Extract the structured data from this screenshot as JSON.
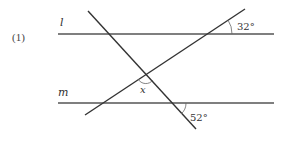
{
  "problem": {
    "number_label": "(1)"
  },
  "lines": {
    "l": {
      "label": "l",
      "y": 34,
      "x1": 58,
      "x2": 274
    },
    "m": {
      "label": "m",
      "y": 103,
      "x1": 58,
      "x2": 274
    },
    "transversal_descending": {
      "x1": 88,
      "y1": 11,
      "x2": 196,
      "y2": 129
    },
    "transversal_ascending": {
      "x1": 85,
      "y1": 115,
      "x2": 245,
      "y2": 9
    }
  },
  "angles": {
    "top_right": {
      "label": "32°"
    },
    "bottom_right": {
      "label": "52°"
    },
    "unknown": {
      "label": "x"
    }
  },
  "colors": {
    "line": "#333333",
    "parallel_line": "#555555",
    "text": "#333333"
  }
}
